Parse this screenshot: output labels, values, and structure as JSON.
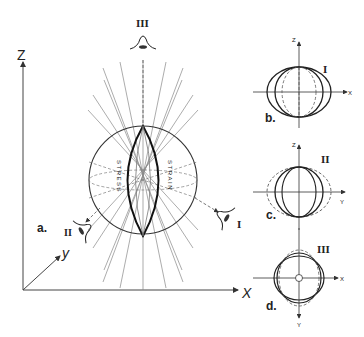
{
  "main_figure": {
    "panel_label": "a.",
    "axes": {
      "z": "Z",
      "y": "y",
      "x": "X"
    },
    "sphere_labels": {
      "left": "STRESS",
      "right": "STRAIN"
    },
    "viewpoints": [
      {
        "id": "I",
        "label": "I",
        "icon": "eye-icon"
      },
      {
        "id": "II",
        "label": "II",
        "icon": "eye-icon"
      },
      {
        "id": "III",
        "label": "III",
        "icon": "eye-icon"
      }
    ]
  },
  "subfigures": [
    {
      "panel_label": "b.",
      "view": "I",
      "horizontal_axis": "X",
      "vertical_axis": "Z"
    },
    {
      "panel_label": "c.",
      "view": "II",
      "horizontal_axis": "Y",
      "vertical_axis": "Z"
    },
    {
      "panel_label": "d.",
      "view": "III",
      "horizontal_axis": "X",
      "vertical_axis": "Y"
    }
  ]
}
